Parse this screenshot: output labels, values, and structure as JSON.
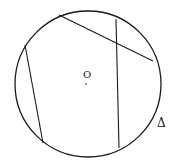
{
  "diagram": {
    "type": "circle-with-chords",
    "circle": {
      "cx": 88,
      "cy": 84,
      "r": 73
    },
    "chords": [
      {
        "name": "top-right-chord",
        "x1": 59,
        "y1": 15,
        "x2": 153,
        "y2": 61
      },
      {
        "name": "vertical-chord",
        "x1": 116,
        "y1": 19,
        "x2": 119,
        "y2": 148
      },
      {
        "name": "left-chord",
        "x1": 25,
        "y1": 45,
        "x2": 43,
        "y2": 143
      }
    ],
    "center_point": {
      "x": 86,
      "y": 84
    },
    "labels": {
      "center": "O",
      "triangle": "Δ"
    },
    "stroke_color": "#1a1a1a"
  }
}
